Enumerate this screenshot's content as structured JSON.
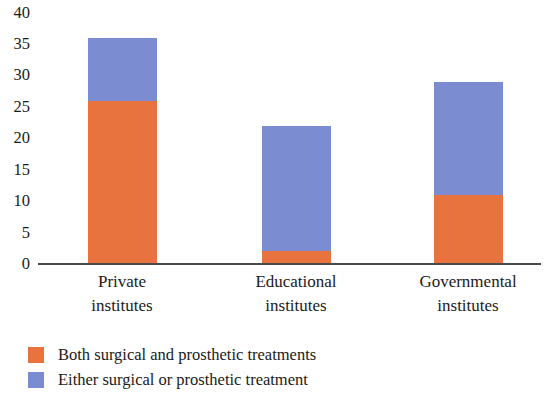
{
  "chart_data": {
    "type": "bar",
    "subtype": "stacked-vertical",
    "title": "",
    "xlabel": "",
    "ylabel": "",
    "categories": [
      "Private institutes",
      "Educational institutes",
      "Governmental institutes"
    ],
    "category_lines": [
      [
        "Private",
        "institutes"
      ],
      [
        "Educational",
        "institutes"
      ],
      [
        "Governmental",
        "institutes"
      ]
    ],
    "series": [
      {
        "name": "Both surgical and prosthetic treatments",
        "color": "#e8733f",
        "values": [
          26,
          2,
          11
        ]
      },
      {
        "name": "Either surgical or prosthetic treatment",
        "color": "#7b8cd1",
        "values": [
          10,
          20,
          18
        ]
      }
    ],
    "totals": [
      36,
      22,
      29
    ],
    "ylim": [
      0,
      40
    ],
    "ytick_values": [
      40,
      35,
      30,
      25,
      20,
      15,
      10,
      5,
      0
    ],
    "ytick_labels": [
      "40",
      "35",
      "30",
      "25",
      "20",
      "15",
      "10",
      "5",
      "0"
    ],
    "grid": "horizontal-dotted",
    "legend_position": "bottom-left"
  },
  "legend": {
    "items": [
      {
        "label": "Both surgical and prosthetic treatments",
        "color": "#e8733f",
        "swatch_name": "legend-swatch-both"
      },
      {
        "label": "Either surgical or prosthetic treatment",
        "color": "#7b8cd1",
        "swatch_name": "legend-swatch-either"
      }
    ]
  }
}
